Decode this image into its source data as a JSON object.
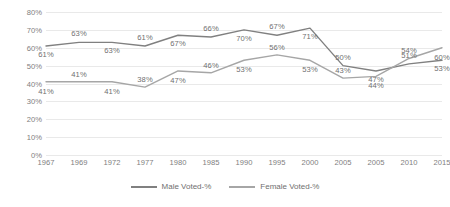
{
  "chart_data": {
    "type": "line",
    "title": "",
    "xlabel": "",
    "ylabel": "",
    "ylim": [
      0,
      80
    ],
    "ytick_step": 10,
    "grid": true,
    "legend_position": "bottom",
    "categories": [
      "1967",
      "1969",
      "1972",
      "1977",
      "1980",
      "1985",
      "1990",
      "1995",
      "2000",
      "2005",
      "2005",
      "2010",
      "2015"
    ],
    "ytick_labels": [
      "80%",
      "70%",
      "60%",
      "50%",
      "40%",
      "30%",
      "20%",
      "10%",
      "0%"
    ],
    "series": [
      {
        "name": "Male Voted-%",
        "color": "#808080",
        "values": [
          61,
          63,
          63,
          61,
          67,
          66,
          70,
          67,
          71,
          50,
          47,
          51,
          53
        ],
        "labels": [
          "61%",
          "63%",
          "63%",
          "61%",
          "67%",
          "66%",
          "70%",
          "67%",
          "71%",
          "50%",
          "47%",
          "51%",
          "53%"
        ]
      },
      {
        "name": "Female Voted-%",
        "color": "#a6a6a6",
        "values": [
          41,
          41,
          41,
          38,
          47,
          46,
          53,
          56,
          53,
          43,
          44,
          54,
          60
        ],
        "labels": [
          "41%",
          "41%",
          "41%",
          "38%",
          "47%",
          "46%",
          "53%",
          "56%",
          "53%",
          "43%",
          "44%",
          "54%",
          "60%"
        ]
      }
    ]
  },
  "legend": {
    "items": [
      {
        "label": "Male Voted-%",
        "color": "#808080"
      },
      {
        "label": "Female Voted-%",
        "color": "#a6a6a6"
      }
    ]
  },
  "colors": {
    "background": "#ffffff",
    "gridline": "#e9e9e9",
    "axis_text": "#808080",
    "label_text": "#6f6f6f"
  }
}
